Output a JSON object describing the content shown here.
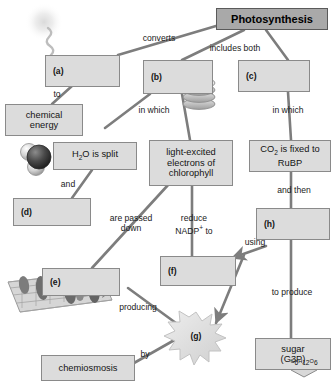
{
  "diagram": {
    "kind": "concept-map",
    "topic": "Photosynthesis",
    "accent_color": "#a9a9a9",
    "node_fill": "#dcdcdc",
    "node_stroke": "#8a8a8a",
    "connector_color": "#7d7d7d"
  },
  "nodes": {
    "photosynthesis": "Photosynthesis",
    "a": "(a)",
    "b": "(b)",
    "c": "(c)",
    "d": "(d)",
    "e": "(e)",
    "f": "(f)",
    "g": "(g)",
    "h": "(h)",
    "chemical_energy_line1": "chemical",
    "chemical_energy_line2": "energy",
    "h2o_split_pre": "H",
    "h2o_split_sub": "2",
    "h2o_split_post": "O is split",
    "light_excited_line1": "light-excited",
    "light_excited_line2": "electrons of",
    "light_excited_line3": "chlorophyll",
    "co2_pre": "CO",
    "co2_sub": "2",
    "co2_post": " is fixed to",
    "co2_line2": "RuBP",
    "chemiosmosis": "chemiosmosis",
    "sugar_line1": "sugar",
    "sugar_line2": "(G3P)",
    "glucose_formula_c": "C",
    "glucose_formula_6": "6",
    "glucose_formula_h": "H",
    "glucose_formula_12": "12",
    "glucose_formula_o": "O",
    "glucose_formula_6b": "6"
  },
  "connector_labels": {
    "converts": "converts",
    "includes_both": "includes both",
    "to": "to",
    "in_which_left": "in which",
    "in_which_right": "in which",
    "and": "and",
    "are_passed": "are passed",
    "down": "down",
    "reduce": "reduce",
    "nadp_pre": "NADP",
    "nadp_sup": "+",
    "nadp_post": " to",
    "and_then": "and then",
    "using": "using",
    "to_produce": "to produce",
    "producing": "producing",
    "by": "by"
  },
  "graphics": {
    "sunlight": "sunlight-ray-icon",
    "granum": "thylakoid-stack-icon",
    "water_molecule": "water-molecule-icon",
    "membrane": "thylakoid-membrane-icon",
    "starburst": "starburst-icon",
    "glucose_hexagon": "glucose-hexagon-icon"
  }
}
